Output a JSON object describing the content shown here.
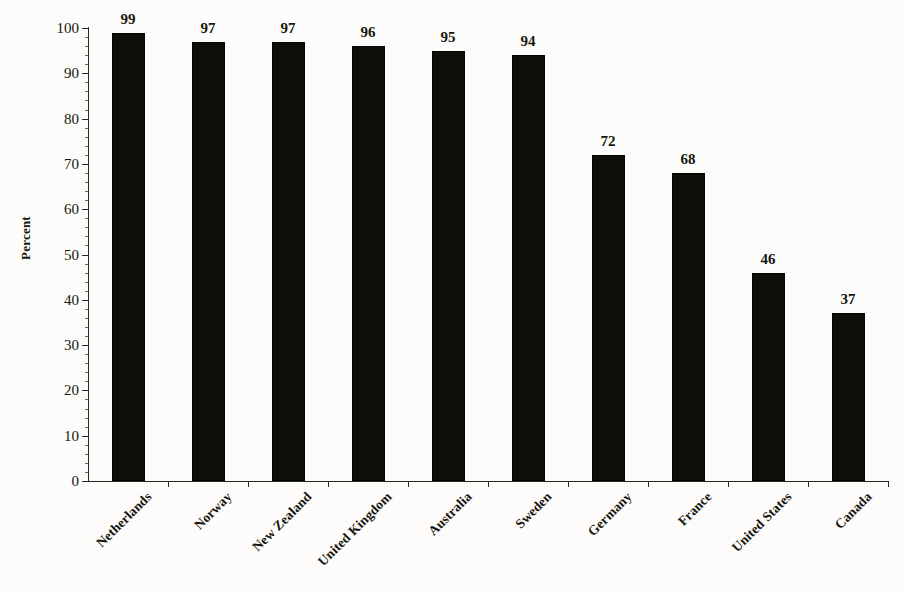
{
  "chart_data": {
    "type": "bar",
    "title": "",
    "xlabel": "",
    "ylabel": "Percent",
    "ylim": [
      0,
      100
    ],
    "ytick_step": 10,
    "yticks": [
      0,
      10,
      20,
      30,
      40,
      50,
      60,
      70,
      80,
      90,
      100
    ],
    "ytick_labels": [
      "0",
      "10",
      "20",
      "30",
      "40",
      "50",
      "60",
      "70",
      "80",
      "90",
      "100"
    ],
    "grid": false,
    "legend": "none",
    "bar_color": "#100e0b",
    "background_color": "#fdfcfa",
    "axis_color": "#2a2722",
    "categories": [
      "Netherlands",
      "Norway",
      "New Zealand",
      "United Kingdom",
      "Australia",
      "Sweden",
      "Germany",
      "France",
      "United States",
      "Canada"
    ],
    "values": [
      99,
      97,
      97,
      96,
      95,
      94,
      72,
      68,
      46,
      37
    ],
    "value_labels": [
      "99",
      "97",
      "97",
      "96",
      "95",
      "94",
      "72",
      "68",
      "46",
      "37"
    ],
    "series": [
      {
        "name": "Percent",
        "values": [
          99,
          97,
          97,
          96,
          95,
          94,
          72,
          68,
          46,
          37
        ]
      }
    ]
  }
}
